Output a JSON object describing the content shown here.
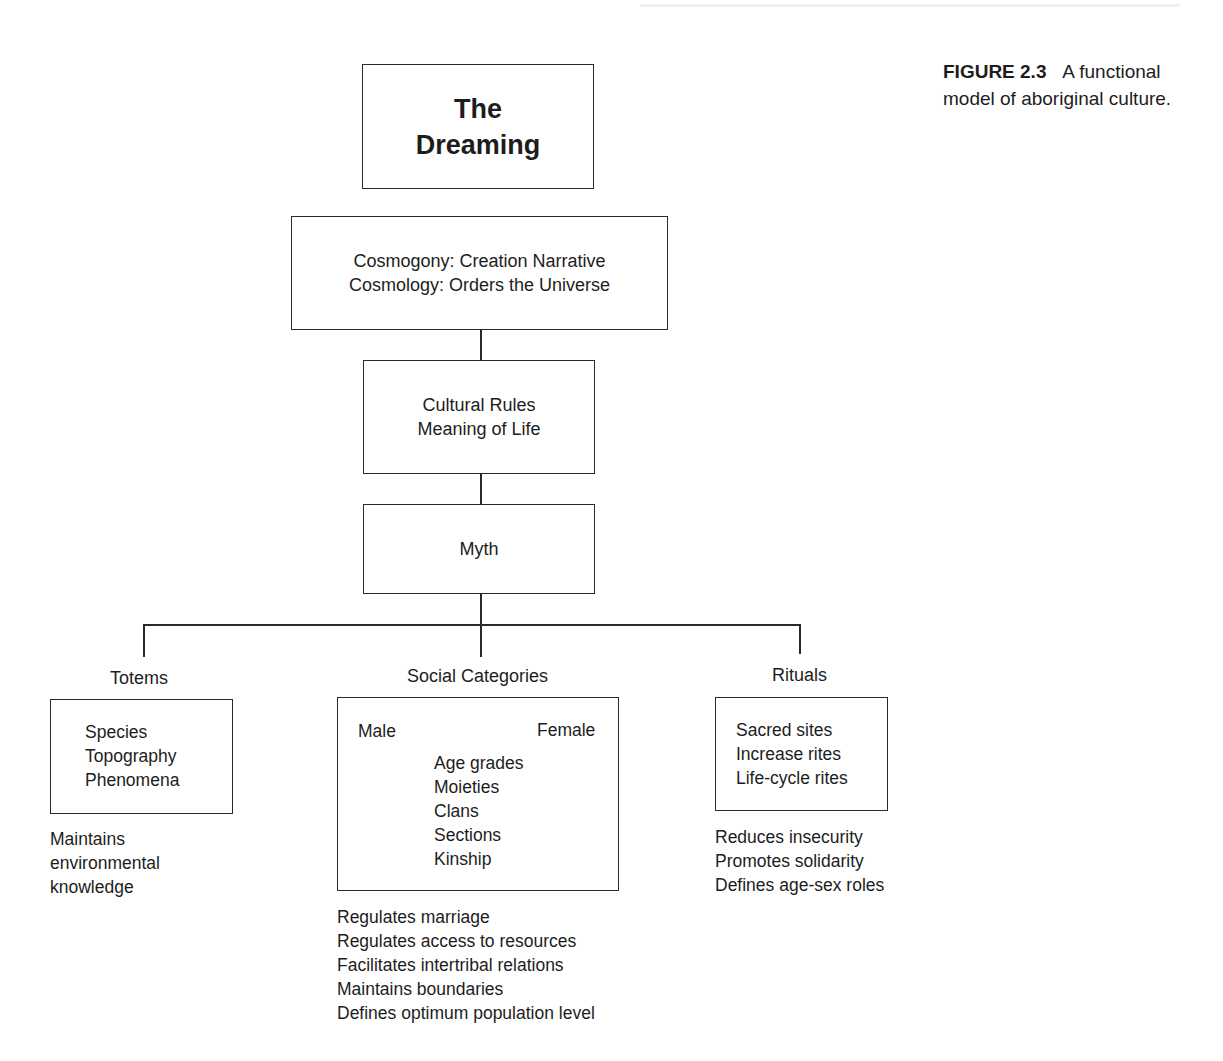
{
  "caption": {
    "figure_number": "FIGURE 2.3",
    "line1_rest": "A functional",
    "line2": "model of aboriginal culture."
  },
  "diagram": {
    "root": {
      "line1": "The",
      "line2": "Dreaming"
    },
    "cosmos": {
      "line1": "Cosmogony:  Creation Narrative",
      "line2": "Cosmology:  Orders the Universe"
    },
    "rules": {
      "line1": "Cultural Rules",
      "line2": "Meaning of Life"
    },
    "myth": {
      "label": "Myth"
    },
    "branches": {
      "totems": {
        "title": "Totems",
        "items": [
          "Species",
          "Topography",
          "Phenomena"
        ],
        "functions": [
          "Maintains",
          "environmental",
          "knowledge"
        ]
      },
      "social": {
        "title": "Social Categories",
        "left": "Male",
        "right": "Female",
        "items": [
          "Age grades",
          "Moieties",
          "Clans",
          "Sections",
          "Kinship"
        ],
        "functions": [
          "Regulates marriage",
          "Regulates access to resources",
          "Facilitates intertribal relations",
          "Maintains boundaries",
          "Defines optimum population level"
        ]
      },
      "rituals": {
        "title": "Rituals",
        "items": [
          "Sacred sites",
          "Increase rites",
          "Life-cycle rites"
        ],
        "functions": [
          "Reduces insecurity",
          "Promotes solidarity",
          "Defines age-sex roles"
        ]
      }
    }
  }
}
